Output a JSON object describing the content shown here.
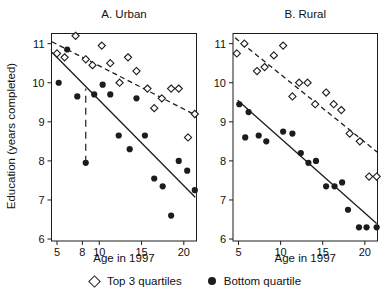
{
  "figure": {
    "ylabel": "Education (years completed)",
    "legend": {
      "top_label": "Top 3 quartiles",
      "bottom_label": "Bottom quartile"
    },
    "ink_color": "#1c1c1c",
    "background": "#ffffff"
  },
  "chart_data": [
    {
      "type": "scatter",
      "title": "A. Urban",
      "xlabel": "Age in 1997",
      "ylabel": "Education (years completed)",
      "xlim": [
        4.35,
        21.5
      ],
      "ylim": [
        5.95,
        11.26
      ],
      "xticks": [
        5,
        8,
        10,
        15,
        20
      ],
      "yticks": [
        6,
        7,
        8,
        9,
        10,
        11
      ],
      "grid": false,
      "series": [
        {
          "name": "Top 3 quartiles",
          "marker": "open-diamond",
          "fit_line_style": "dashed",
          "fit_line": [
            [
              4.4,
              11.05
            ],
            [
              21.5,
              9.16
            ]
          ],
          "points": [
            [
              5.0,
              10.75
            ],
            [
              5.9,
              10.65
            ],
            [
              7.2,
              11.2
            ],
            [
              8.4,
              10.6
            ],
            [
              9.2,
              10.45
            ],
            [
              10.3,
              10.95
            ],
            [
              11.3,
              10.5
            ],
            [
              12.4,
              10.0
            ],
            [
              13.4,
              10.65
            ],
            [
              14.4,
              10.3
            ],
            [
              15.7,
              9.85
            ],
            [
              16.5,
              9.35
            ],
            [
              17.4,
              9.6
            ],
            [
              18.5,
              9.85
            ],
            [
              19.4,
              9.85
            ],
            [
              20.5,
              8.6
            ],
            [
              21.3,
              9.2
            ]
          ]
        },
        {
          "name": "Bottom quartile",
          "marker": "filled-circle",
          "fit_line_style": "solid",
          "fit_line": [
            [
              4.4,
              10.78
            ],
            [
              21.35,
              7.07
            ]
          ],
          "points": [
            [
              5.2,
              10.0
            ],
            [
              6.2,
              10.85
            ],
            [
              7.4,
              9.65
            ],
            [
              8.4,
              7.95
            ],
            [
              9.4,
              9.7
            ],
            [
              10.4,
              9.95
            ],
            [
              11.3,
              9.7
            ],
            [
              12.3,
              8.65
            ],
            [
              13.6,
              8.3
            ],
            [
              14.4,
              9.6
            ],
            [
              15.4,
              8.65
            ],
            [
              16.5,
              7.55
            ],
            [
              17.5,
              7.35
            ],
            [
              18.5,
              6.6
            ],
            [
              19.4,
              8.0
            ],
            [
              20.4,
              7.75
            ],
            [
              21.3,
              7.25
            ]
          ]
        }
      ],
      "annotations": [
        {
          "type": "vertical-dashed-segment",
          "x": 8.4,
          "y_from": 7.95,
          "y_to": 9.85
        }
      ]
    },
    {
      "type": "scatter",
      "title": "B. Rural",
      "xlabel": "Age in 1997",
      "ylabel": "Education (years completed)",
      "xlim": [
        4.35,
        21.5
      ],
      "ylim": [
        5.95,
        11.26
      ],
      "xticks": [
        5,
        10,
        15,
        20
      ],
      "yticks": [
        6,
        7,
        8,
        9,
        10,
        11
      ],
      "grid": false,
      "series": [
        {
          "name": "Top 3 quartiles",
          "marker": "open-diamond",
          "fit_line_style": "dashed",
          "fit_line": [
            [
              4.6,
              11.15
            ],
            [
              21.5,
              8.22
            ]
          ],
          "points": [
            [
              4.8,
              10.75
            ],
            [
              5.7,
              11.0
            ],
            [
              7.2,
              10.3
            ],
            [
              8.1,
              10.4
            ],
            [
              9.2,
              10.7
            ],
            [
              10.3,
              10.95
            ],
            [
              11.4,
              9.65
            ],
            [
              12.2,
              10.0
            ],
            [
              13.2,
              10.0
            ],
            [
              14.1,
              9.45
            ],
            [
              15.4,
              9.75
            ],
            [
              16.3,
              9.45
            ],
            [
              17.2,
              9.3
            ],
            [
              18.2,
              8.7
            ],
            [
              19.4,
              8.5
            ],
            [
              20.5,
              7.6
            ],
            [
              21.4,
              7.6
            ]
          ]
        },
        {
          "name": "Bottom quartile",
          "marker": "filled-circle",
          "fit_line_style": "solid",
          "fit_line": [
            [
              4.9,
              9.55
            ],
            [
              21.4,
              6.4
            ]
          ],
          "points": [
            [
              5.1,
              9.45
            ],
            [
              6.2,
              9.25
            ],
            [
              5.8,
              8.6
            ],
            [
              7.4,
              8.65
            ],
            [
              8.3,
              8.5
            ],
            [
              10.3,
              8.75
            ],
            [
              11.4,
              8.7
            ],
            [
              12.4,
              8.2
            ],
            [
              13.3,
              7.95
            ],
            [
              14.2,
              8.0
            ],
            [
              15.4,
              7.35
            ],
            [
              16.4,
              7.35
            ],
            [
              17.3,
              7.45
            ],
            [
              18.0,
              6.75
            ],
            [
              19.3,
              6.3
            ],
            [
              20.2,
              6.3
            ],
            [
              21.4,
              6.3
            ]
          ]
        }
      ],
      "annotations": []
    }
  ]
}
